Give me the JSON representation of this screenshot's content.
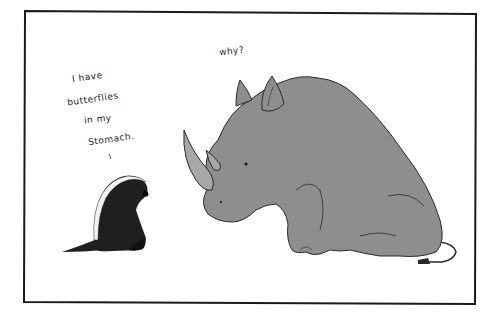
{
  "comic": {
    "badger_speech": [
      "I have",
      "butterflies",
      "in my",
      "Stomach."
    ],
    "rhino_speech": "why?",
    "characters": [
      "honey-badger",
      "rhinoceros"
    ],
    "colors": {
      "frame": "#1a1a1a",
      "background": "#ffffff",
      "rhino_fill": "#8e8e8e",
      "rhino_outline": "#2a2a2a",
      "horn_fill": "#a8a8a8",
      "badger_fill": "#1f1f1f",
      "badger_stripe": "#f2f2f2"
    }
  }
}
